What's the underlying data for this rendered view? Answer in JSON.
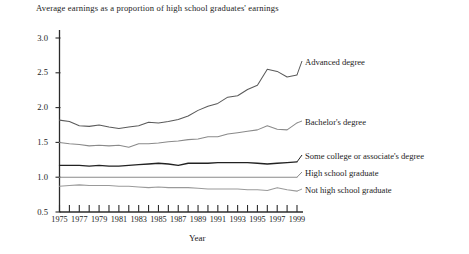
{
  "chart_data": {
    "type": "line",
    "title": "Average earnings as a proportion of high school graduates' earnings",
    "xlabel": "Year",
    "ylabel": "",
    "xlim": [
      1975,
      1999
    ],
    "ylim": [
      0.5,
      3.0
    ],
    "grid": false,
    "legend_position": "right-inline",
    "ytick_labels": [
      "3.0",
      "2.5",
      "2.0",
      "1.5",
      "1.0",
      "0.5"
    ],
    "ytick_values": [
      3.0,
      2.5,
      2.0,
      1.5,
      1.0,
      0.5
    ],
    "xtick_labels": [
      "1975",
      "1977",
      "1979",
      "1981",
      "1983",
      "1985",
      "1987",
      "1989",
      "1991",
      "1993",
      "1995",
      "1997",
      "1999"
    ],
    "xtick_values": [
      1975,
      1977,
      1979,
      1981,
      1983,
      1985,
      1987,
      1989,
      1991,
      1993,
      1995,
      1997,
      1999
    ],
    "x": [
      1975,
      1976,
      1977,
      1978,
      1979,
      1980,
      1981,
      1982,
      1983,
      1984,
      1985,
      1986,
      1987,
      1988,
      1989,
      1990,
      1991,
      1992,
      1993,
      1994,
      1995,
      1996,
      1997,
      1998,
      1999
    ],
    "series": [
      {
        "name": "Advanced degree",
        "color": "#5a5a5a",
        "values": [
          1.82,
          1.8,
          1.74,
          1.73,
          1.75,
          1.72,
          1.7,
          1.72,
          1.74,
          1.79,
          1.78,
          1.8,
          1.83,
          1.88,
          1.96,
          2.02,
          2.06,
          2.15,
          2.17,
          2.26,
          2.32,
          2.55,
          2.52,
          2.44,
          2.47
        ]
      },
      {
        "name": "Bachelor's degree",
        "color": "#8a8a8a",
        "values": [
          1.5,
          1.48,
          1.47,
          1.45,
          1.46,
          1.45,
          1.46,
          1.43,
          1.48,
          1.48,
          1.49,
          1.51,
          1.52,
          1.54,
          1.55,
          1.58,
          1.58,
          1.62,
          1.64,
          1.66,
          1.68,
          1.74,
          1.69,
          1.68,
          1.78
        ]
      },
      {
        "name": "Some college or associate's degree",
        "color": "#222222",
        "values": [
          1.17,
          1.17,
          1.17,
          1.16,
          1.17,
          1.16,
          1.16,
          1.17,
          1.18,
          1.19,
          1.2,
          1.19,
          1.17,
          1.2,
          1.2,
          1.2,
          1.21,
          1.21,
          1.21,
          1.21,
          1.2,
          1.19,
          1.2,
          1.21,
          1.22
        ]
      },
      {
        "name": "High school graduate",
        "color": "#8a8a8a",
        "values": [
          1.0,
          1.0,
          1.0,
          1.0,
          1.0,
          1.0,
          1.0,
          1.0,
          1.0,
          1.0,
          1.0,
          1.0,
          1.0,
          1.0,
          1.0,
          1.0,
          1.0,
          1.0,
          1.0,
          1.0,
          1.0,
          1.0,
          1.0,
          1.0,
          1.0
        ]
      },
      {
        "name": "Not high school graduate",
        "color": "#9a9a9a",
        "values": [
          0.87,
          0.88,
          0.89,
          0.88,
          0.88,
          0.88,
          0.87,
          0.87,
          0.86,
          0.85,
          0.86,
          0.85,
          0.85,
          0.85,
          0.84,
          0.83,
          0.83,
          0.83,
          0.83,
          0.82,
          0.82,
          0.81,
          0.85,
          0.82,
          0.8
        ]
      }
    ],
    "series_labels": [
      {
        "text": "Advanced degree",
        "x": 305,
        "y": 64
      },
      {
        "text": "Bachelor's degree",
        "x": 305,
        "y": 124
      },
      {
        "text": "Some college or associate's degree",
        "x": 305,
        "y": 158
      },
      {
        "text": "High school graduate",
        "x": 305,
        "y": 175
      },
      {
        "text": "Not high school graduate",
        "x": 305,
        "y": 192
      }
    ]
  }
}
